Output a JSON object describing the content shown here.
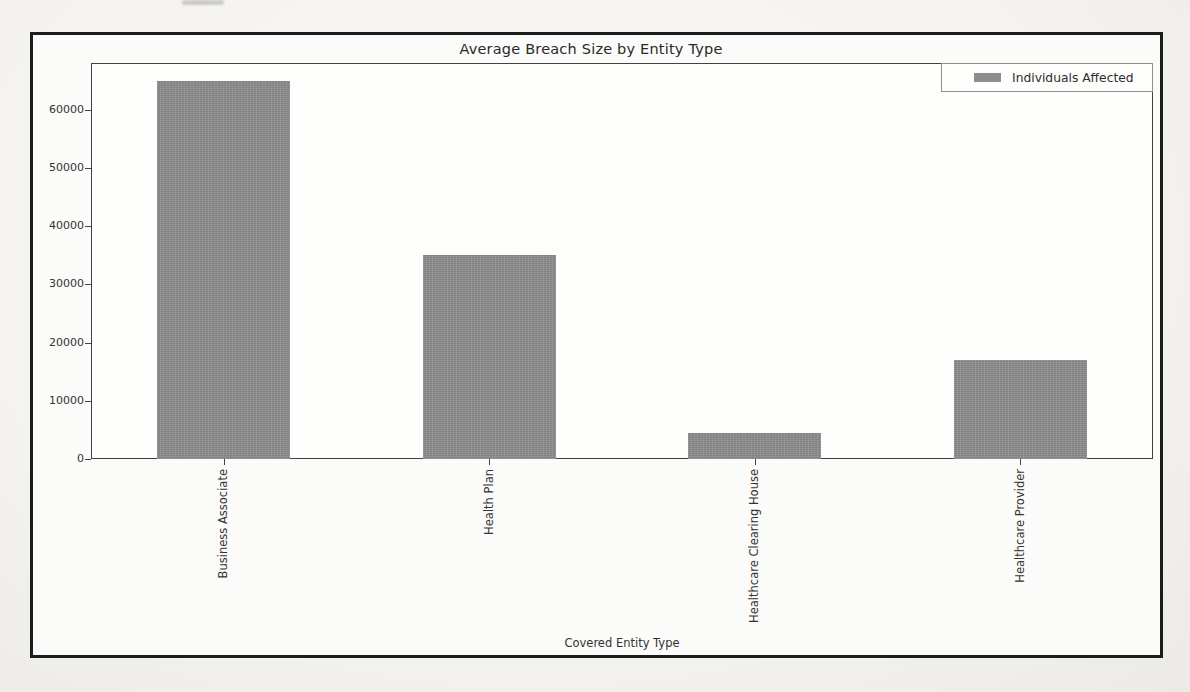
{
  "chart_data": {
    "type": "bar",
    "title": "Average Breach Size by Entity Type",
    "xlabel": "Covered Entity Type",
    "ylabel": "",
    "categories": [
      "Business Associate",
      "Health Plan",
      "Healthcare Clearing House",
      "Healthcare Provider"
    ],
    "series": [
      {
        "name": "Individuals Affected",
        "values": [
          65000,
          35000,
          4500,
          17000
        ]
      }
    ],
    "yticks": [
      0,
      10000,
      20000,
      30000,
      40000,
      50000,
      60000
    ],
    "ylim": [
      0,
      68000
    ],
    "grid": false,
    "bar_width_fraction": 0.5,
    "legend": {
      "position": "upper right",
      "entries": [
        "Individuals Affected"
      ]
    },
    "colors": {
      "bar": "#8d8d8d",
      "text": "#2e2e2e",
      "spine": "#424242",
      "frame_border": "#1c1c1c",
      "plot_background": "#fdfdfc",
      "page_background": "#f4f3f0"
    }
  }
}
